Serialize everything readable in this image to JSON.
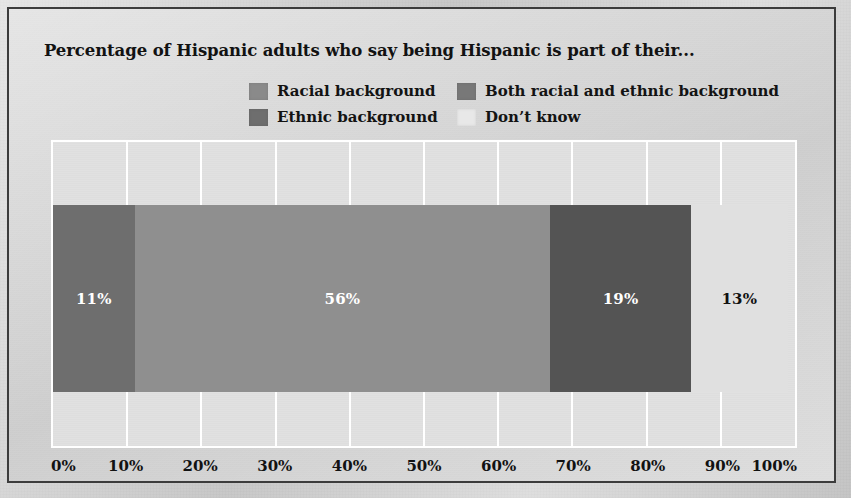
{
  "title": "Percentage of Hispanic adults who say being Hispanic is part of their...",
  "legend": [
    {
      "label": "Racial background",
      "color": "#8a8a8a"
    },
    {
      "label": "Ethnic background",
      "color": "#6e6e6e"
    },
    {
      "label": "Both racial and ethnic background",
      "color": "#787878"
    },
    {
      "label": "Don’t know",
      "color": "#e8e8e8"
    }
  ],
  "colors": {
    "frame_border": "#3c3c3c",
    "page_background": "#c6c6c6",
    "plot_background": "#e2e2e2",
    "gridline": "#ffffff",
    "title_text": "#121212"
  },
  "chart_data": {
    "type": "bar",
    "orientation": "horizontal",
    "stacked": true,
    "title": "Percentage of Hispanic adults who say being Hispanic is part of their...",
    "xlabel": "",
    "ylabel": "",
    "xlim": [
      0,
      100
    ],
    "grid": true,
    "legend_position": "top",
    "categories": [
      "All Hispanic adults"
    ],
    "xticks": [
      0,
      10,
      20,
      30,
      40,
      50,
      60,
      70,
      80,
      90,
      100
    ],
    "xticklabels": [
      "0%",
      "10%",
      "20%",
      "30%",
      "40%",
      "50%",
      "60%",
      "70%",
      "80%",
      "90%",
      "100%"
    ],
    "series": [
      {
        "name": "Racial background",
        "values": [
          11
        ],
        "color": "#6e6e6e",
        "data_label": "11%",
        "label_color": "#ffffff"
      },
      {
        "name": "Ethnic background",
        "values": [
          56
        ],
        "color": "#8f8f8f",
        "data_label": "56%",
        "label_color": "#ffffff"
      },
      {
        "name": "Both racial and ethnic background",
        "values": [
          19
        ],
        "color": "#545454",
        "data_label": "19%",
        "label_color": "#ffffff"
      },
      {
        "name": "Don’t know",
        "values": [
          13
        ],
        "color": "#e0e0e0",
        "data_label": "13%",
        "label_color": "#111111"
      }
    ],
    "segment_offsets": [
      0,
      11,
      67,
      86
    ],
    "total": 99
  }
}
